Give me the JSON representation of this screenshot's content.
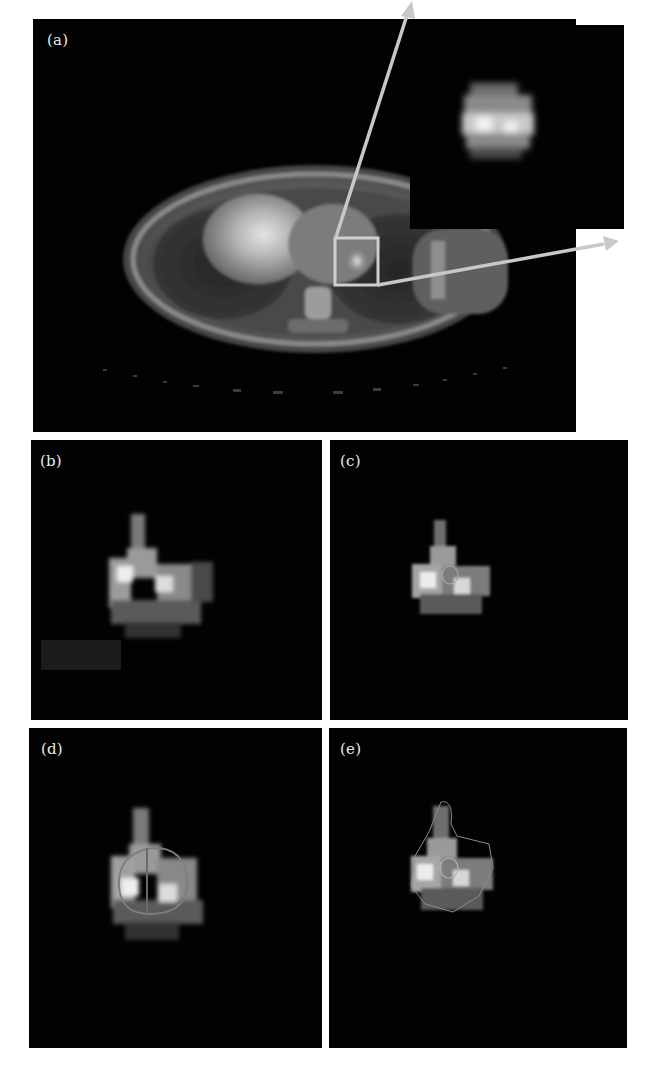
{
  "figure": {
    "panels": [
      {
        "id": "a",
        "label": "(a)",
        "description": "Axial fused PET/CT slice of thorax with ROI box and magnified inset of tracer uptake"
      },
      {
        "id": "b",
        "label": "(b)",
        "description": "Magnified PET uptake region, no contour"
      },
      {
        "id": "c",
        "label": "(c)",
        "description": "Uptake region with small circular contour"
      },
      {
        "id": "d",
        "label": "(d)",
        "description": "Uptake region with large circular contour"
      },
      {
        "id": "e",
        "label": "(e)",
        "description": "Uptake region with irregular outer contour and small inner contour"
      }
    ],
    "colors": {
      "background": "#020202",
      "page": "#ffffff",
      "arrow": "#c8c8c8",
      "roi_box": "#cfcfcf",
      "label": "#e8e8e8",
      "contour": "#9a9a9a"
    }
  }
}
